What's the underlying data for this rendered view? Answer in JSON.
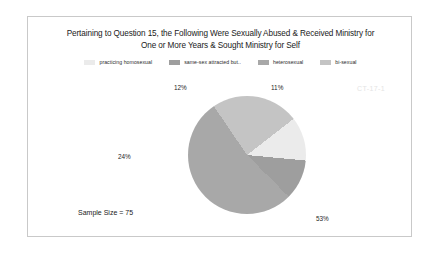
{
  "watermark": "CT-17-1",
  "sample_size_note": "Sample Size = 75",
  "chart_data": {
    "type": "pie",
    "title": "Pertaining to Question 15, the Following Were Sexually Abused & Received Ministry for One or More Years & Sought Ministry for Self",
    "title_line_1": "Pertaining to Question 15, the Following Were Sexually Abused & Received Ministry for",
    "title_line_2": "One or More Years & Sought Ministry for Self",
    "xlabel": "",
    "ylabel": "",
    "legend_position": "top",
    "grid": false,
    "sample_size": 75,
    "categories": [
      "practicing homosexual",
      "same-sex attracted but..",
      "heterosexual",
      "bi-sexual"
    ],
    "values": [
      12,
      11,
      53,
      24
    ],
    "value_labels": [
      "12%",
      "11%",
      "53%",
      "24%"
    ],
    "colors": [
      "#ebebeb",
      "#9e9e9e",
      "#a8a8a8",
      "#c4c4c4"
    ],
    "slices": [
      {
        "label": "practicing homosexual",
        "value": 12,
        "display": "12%",
        "color": "#ebebeb"
      },
      {
        "label": "same-sex attracted but..",
        "value": 11,
        "display": "11%",
        "color": "#9e9e9e"
      },
      {
        "label": "heterosexual",
        "value": 53,
        "display": "53%",
        "color": "#a8a8a8"
      },
      {
        "label": "bi-sexual",
        "value": 24,
        "display": "24%",
        "color": "#c4c4c4"
      }
    ]
  }
}
